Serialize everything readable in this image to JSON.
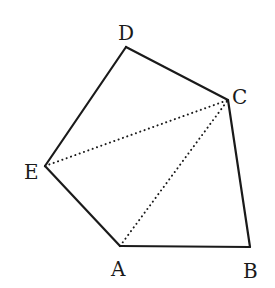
{
  "diagram": {
    "type": "pentagon-triangulation",
    "stroke_color": "#1a1a1a",
    "vertices": [
      {
        "label": "A",
        "x": 120,
        "y": 246,
        "lx": 111,
        "ly": 276
      },
      {
        "label": "B",
        "x": 250,
        "y": 247,
        "lx": 243,
        "ly": 278
      },
      {
        "label": "C",
        "x": 228,
        "y": 100,
        "lx": 232,
        "ly": 104
      },
      {
        "label": "D",
        "x": 126,
        "y": 47,
        "lx": 118,
        "ly": 40
      },
      {
        "label": "E",
        "x": 45,
        "y": 166,
        "lx": 24,
        "ly": 179
      }
    ],
    "solid_edges": [
      [
        "A",
        "B"
      ],
      [
        "B",
        "C"
      ],
      [
        "C",
        "D"
      ],
      [
        "D",
        "E"
      ],
      [
        "E",
        "A"
      ]
    ],
    "dotted_edges": [
      [
        "E",
        "C"
      ],
      [
        "A",
        "C"
      ]
    ]
  }
}
